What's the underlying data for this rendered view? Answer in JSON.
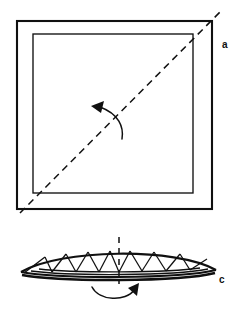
{
  "figure": {
    "background_color": "#ffffff",
    "line_color": "#101010",
    "width": 248,
    "height": 312,
    "panels": [
      {
        "id": "a",
        "label": "a",
        "label_x": 222,
        "label_y": 40,
        "description": "Square sheet seen in plan with double border, diagonal dashed fold line from bottom-left to top-right, and curved rotation arrow pointing up-left",
        "shapes": {
          "outer_square": {
            "x1": 17,
            "y1": 21,
            "x2": 212,
            "y2": 209
          },
          "inner_square": {
            "x1": 33,
            "y1": 34,
            "x2": 193,
            "y2": 193
          },
          "fold_line": {
            "x1": 20,
            "y1": 213,
            "x2": 222,
            "y2": 10,
            "style": "dashed"
          },
          "rotation_arrow": {
            "from_x": 122,
            "from_y": 138,
            "to_x": 93,
            "to_y": 107,
            "direction": "up-left"
          }
        }
      },
      {
        "id": "c",
        "label": "c",
        "label_x": 219,
        "label_y": 275,
        "description": "Folded sheet seen edge-on as a shallow triangulated lens / fan with zigzag pleat ribs, a vertical dashed symmetry axis and a curved rotation arrow beneath pointing right",
        "shapes": {
          "lens": {
            "left_x": 21,
            "right_x": 216,
            "base_y": 273,
            "peak_y": 252
          },
          "axis_line": {
            "x": 119,
            "y1": 237,
            "y2": 284,
            "style": "dashed"
          },
          "rotation_arrow": {
            "from_x": 92,
            "from_y": 288,
            "to_x": 138,
            "to_y": 286,
            "direction": "right"
          },
          "pleat_count": 10
        }
      }
    ]
  },
  "labels": {
    "a": "a",
    "c": "c"
  }
}
